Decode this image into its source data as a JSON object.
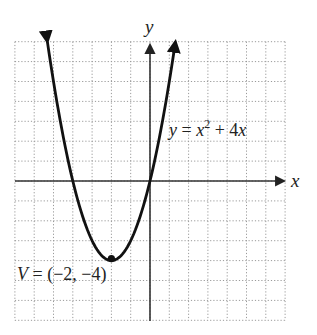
{
  "chart_data": {
    "type": "line",
    "title": "",
    "xlabel": "x",
    "ylabel": "y",
    "xlim": [
      -7,
      7
    ],
    "ylim": [
      -7,
      7
    ],
    "grid": true,
    "grid_style": "dotted",
    "tick_labels_shown": false,
    "series": [
      {
        "name": "y = x^2 + 4x",
        "equation": "y = x^2 + 4x",
        "x": [
          -5.317,
          -5,
          -4,
          -3,
          -2,
          -1,
          0,
          1,
          1.317
        ],
        "y": [
          7,
          5,
          0,
          -3,
          -4,
          -3,
          0,
          5,
          7
        ],
        "arrows_at_ends": true
      }
    ],
    "annotations": [
      {
        "text": "y = x² + 4x",
        "at": [
          0.8,
          3.5
        ]
      },
      {
        "text": "V = (−2, −4)",
        "point": [
          -2,
          -4
        ],
        "marker": "dot"
      }
    ]
  },
  "labels": {
    "x_axis": "x",
    "y_axis": "y",
    "equation_main": "y = x",
    "equation_exp": "2",
    "equation_rest": " + 4x",
    "vertex": "V = (−2, −4)"
  },
  "colors": {
    "curve": "#111111",
    "axis": "#333333",
    "grid": "#9a9a9a",
    "text": "#222222"
  }
}
